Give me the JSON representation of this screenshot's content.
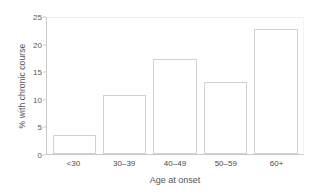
{
  "chart_data": {
    "type": "bar",
    "title": "",
    "subtitle": "",
    "xlabel": "Age at onset",
    "ylabel": "% with chronic course",
    "categories": [
      "<30",
      "30–39",
      "40–49",
      "50–59",
      "60+"
    ],
    "values": [
      3.4,
      10.7,
      17.2,
      13.0,
      22.6
    ],
    "series": [
      {
        "name": "% with chronic course",
        "values": [
          3.4,
          10.7,
          17.2,
          13.0,
          22.6
        ]
      }
    ],
    "ylim": [
      0,
      25
    ],
    "yticks": [
      0,
      5,
      10,
      15,
      20,
      25
    ],
    "ytick_labels": [
      "0",
      "5",
      "10",
      "15",
      "20",
      "25"
    ],
    "grid": false,
    "legend": "none",
    "bar_fill_color": "#ffffff",
    "bar_edge_color": "#d2d2d2",
    "axis_color": "#c9c9c9",
    "background_color": "#ffffff",
    "text_color": "#4a4a4a"
  }
}
